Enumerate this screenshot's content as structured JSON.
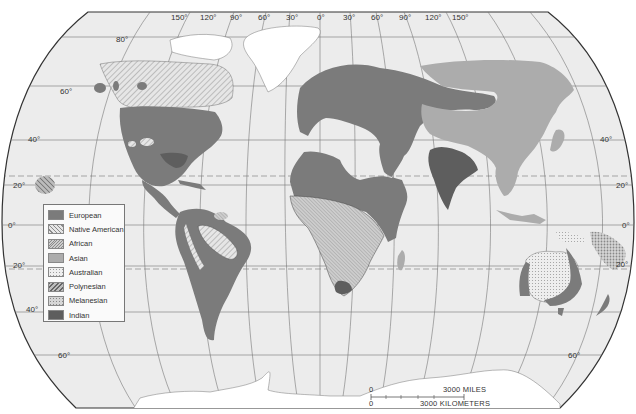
{
  "map": {
    "projection": "world",
    "colors": {
      "ocean": "#ececec",
      "land_unshaded": "#e6e6e6",
      "ice": "#ffffff",
      "european": "#7b7b7b",
      "native_american_bg": "#e0e0e0",
      "african_bg": "#c8c8c8",
      "asian": "#acacac",
      "australian_bg": "#ececec",
      "polynesian_bg": "#aaaaaa",
      "melanesian_bg": "#bdbdbd",
      "indian": "#5e5e5e",
      "gridline": "#666666"
    },
    "longitude_labels": [
      "150°",
      "120°",
      "90°",
      "60°",
      "30°",
      "0°",
      "30°",
      "60°",
      "90°",
      "120°",
      "150°"
    ],
    "latitude_labels_left": [
      "80°",
      "60°",
      "40°",
      "20°",
      "0°",
      "20°",
      "40°",
      "60°"
    ],
    "latitude_labels_right": [
      "40°",
      "20°",
      "0°",
      "20°",
      "60°"
    ]
  },
  "legend": {
    "items": [
      {
        "label": "European",
        "pattern": "european"
      },
      {
        "label": "Native American",
        "pattern": "native-american"
      },
      {
        "label": "African",
        "pattern": "african"
      },
      {
        "label": "Asian",
        "pattern": "asian"
      },
      {
        "label": "Australian",
        "pattern": "australian"
      },
      {
        "label": "Polynesian",
        "pattern": "polynesian"
      },
      {
        "label": "Melanesian",
        "pattern": "melanesian"
      },
      {
        "label": "Indian",
        "pattern": "indian"
      }
    ]
  },
  "scale_bar": {
    "zero_top": "0",
    "zero_bottom": "0",
    "miles_label": "3000  MILES",
    "km_label": "3000  KILOMETERS"
  }
}
